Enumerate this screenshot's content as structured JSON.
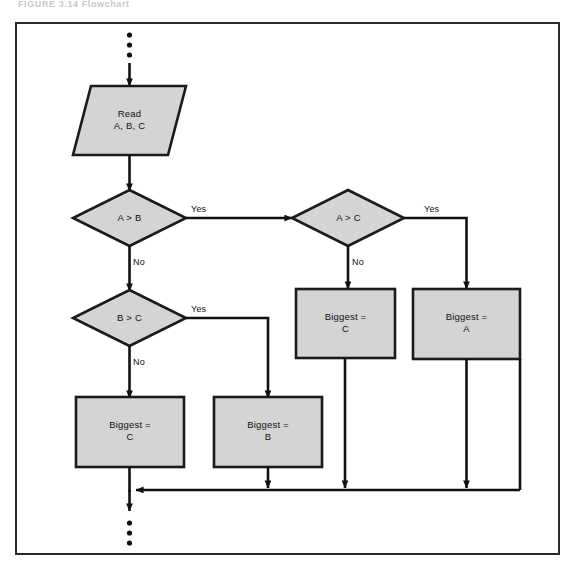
{
  "figure": {
    "caption_remnant": "FIGURE 3.14  Flowchart"
  },
  "diagram": {
    "type": "flowchart",
    "colors": {
      "node_fill": "#d4d4d4",
      "node_stroke": "#1a1a1a",
      "line": "#111111",
      "frame": "#2a2a2a",
      "page_background": "#ffffff"
    },
    "terminators": {
      "entry_ellipsis": "⋮",
      "exit_ellipsis": "⋮"
    },
    "nodes": [
      {
        "id": "read",
        "shape": "parallelogram",
        "label_line1": "Read",
        "label_line2": "A, B, C"
      },
      {
        "id": "a_gt_b",
        "shape": "diamond",
        "label_line1": "A > B",
        "label_line2": ""
      },
      {
        "id": "a_gt_c",
        "shape": "diamond",
        "label_line1": "A > C",
        "label_line2": ""
      },
      {
        "id": "b_gt_c",
        "shape": "diamond",
        "label_line1": "B > C",
        "label_line2": ""
      },
      {
        "id": "biggest_c_mid",
        "shape": "rectangle",
        "label_line1": "Biggest =",
        "label_line2": "C"
      },
      {
        "id": "biggest_a",
        "shape": "rectangle",
        "label_line1": "Biggest =",
        "label_line2": "A"
      },
      {
        "id": "biggest_c_low",
        "shape": "rectangle",
        "label_line1": "Biggest =",
        "label_line2": "C"
      },
      {
        "id": "biggest_b",
        "shape": "rectangle",
        "label_line1": "Biggest =",
        "label_line2": "B"
      }
    ],
    "edge_labels": {
      "a_gt_b_yes": "Yes",
      "a_gt_b_no": "No",
      "a_gt_c_yes": "Yes",
      "a_gt_c_no": "No",
      "b_gt_c_yes": "Yes",
      "b_gt_c_no": "No"
    }
  }
}
